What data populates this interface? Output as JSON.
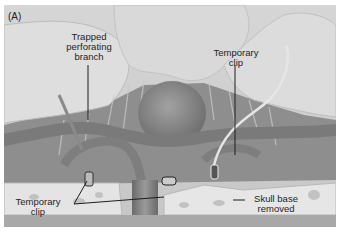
{
  "figure": {
    "panel_label": "(A)",
    "style": "grayscale surgical illustration",
    "colors": {
      "background": "#ffffff",
      "brain": "#dcdcdc",
      "brain_shadow": "#a9a9a9",
      "cistern": "#8e8e8e",
      "vessel": "#7a7a7a",
      "aneurysm": "#8a8a8a",
      "bone": "#e6e6e6",
      "bone_dark": "#b5b5b5",
      "leader_line": "#1e1e1e"
    },
    "annotations": [
      {
        "id": "trapped-perforating-branch",
        "text": "Trapped\nperforating\nbranch"
      },
      {
        "id": "temporary-clip-right",
        "text": "Temporary\nclip"
      },
      {
        "id": "temporary-clip-left",
        "text": "Temporary\nclip"
      },
      {
        "id": "skull-base-removed",
        "text": "Skull base\nremoved"
      }
    ]
  }
}
